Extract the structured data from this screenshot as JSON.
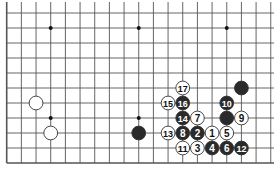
{
  "board": {
    "description": "Go board diagram, lower-left/right region of 19x19 board",
    "grid": {
      "x0": 6.7,
      "dx": 14.67,
      "cols": 19,
      "y0": 13,
      "dy": 15,
      "rows": 11,
      "extend_top": true,
      "left_edge": true,
      "bottom_edge": true,
      "right_edge": false
    },
    "star_points": [
      [
        3,
        1
      ],
      [
        9,
        1
      ],
      [
        15,
        1
      ],
      [
        3,
        7
      ],
      [
        9,
        7
      ],
      [
        15,
        7
      ]
    ],
    "stones": [
      {
        "col": 2,
        "row": 6,
        "color": "white",
        "label": ""
      },
      {
        "col": 3,
        "row": 8,
        "color": "white",
        "label": ""
      },
      {
        "col": 9,
        "row": 8,
        "color": "black",
        "label": ""
      },
      {
        "col": 16,
        "row": 5,
        "color": "black",
        "label": ""
      },
      {
        "col": 15,
        "row": 7,
        "color": "black",
        "label": ""
      },
      {
        "col": 12,
        "row": 5,
        "color": "white",
        "label": "17"
      },
      {
        "col": 11,
        "row": 6,
        "color": "white",
        "label": "15"
      },
      {
        "col": 12,
        "row": 6,
        "color": "black",
        "label": "16"
      },
      {
        "col": 15,
        "row": 6,
        "color": "black",
        "label": "10"
      },
      {
        "col": 12,
        "row": 7,
        "color": "black",
        "label": "14"
      },
      {
        "col": 13,
        "row": 7,
        "color": "white",
        "label": "7"
      },
      {
        "col": 16,
        "row": 7,
        "color": "white",
        "label": "9"
      },
      {
        "col": 11,
        "row": 8,
        "color": "white",
        "label": "13"
      },
      {
        "col": 12,
        "row": 8,
        "color": "black",
        "label": "8"
      },
      {
        "col": 13,
        "row": 8,
        "color": "black",
        "label": "2"
      },
      {
        "col": 14,
        "row": 8,
        "color": "white",
        "label": "1"
      },
      {
        "col": 15,
        "row": 8,
        "color": "white",
        "label": "5"
      },
      {
        "col": 12,
        "row": 9,
        "color": "white",
        "label": "11"
      },
      {
        "col": 13,
        "row": 9,
        "color": "white",
        "label": "3"
      },
      {
        "col": 14,
        "row": 9,
        "color": "black",
        "label": "4"
      },
      {
        "col": 15,
        "row": 9,
        "color": "black",
        "label": "6"
      },
      {
        "col": 16,
        "row": 9,
        "color": "black",
        "label": "12"
      }
    ],
    "colors": {
      "line": "#555555",
      "black_stone": "#2a2a2a",
      "white_stone": "#ffffff",
      "background": "#ffffff"
    }
  }
}
